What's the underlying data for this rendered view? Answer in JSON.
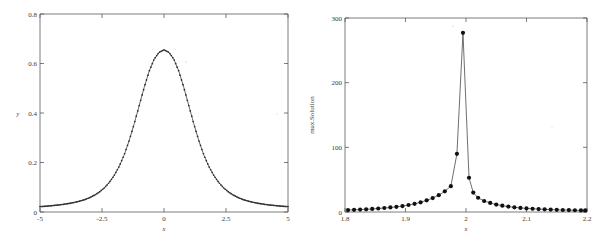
{
  "figure": {
    "background": "#ffffff",
    "panel_count": 2
  },
  "chart_data": [
    {
      "type": "line",
      "panel": "left",
      "title": "",
      "xlabel": "x",
      "ylabel": "y",
      "xlim": [
        -5,
        5
      ],
      "ylim": [
        0,
        0.8
      ],
      "xticks": [
        -5,
        -2.5,
        0,
        2.5,
        5
      ],
      "xticklabels": [
        "-5",
        "-2.5",
        "0",
        "2.5",
        "5"
      ],
      "yticks": [
        0,
        0.2,
        0.4,
        0.6,
        0.8
      ],
      "yticklabels": [
        "0",
        "0.2",
        "0.4",
        "0.6",
        "0.8"
      ],
      "grid": false,
      "legend": null,
      "marker": "dot",
      "marker_color": "#2e2e2e",
      "line_color": "#555555",
      "series": [
        {
          "name": "bell-curve",
          "x": [
            -5,
            -4.8,
            -4.6,
            -4.4,
            -4.2,
            -4,
            -3.8,
            -3.6,
            -3.4,
            -3.2,
            -3,
            -2.8,
            -2.6,
            -2.4,
            -2.2,
            -2,
            -1.8,
            -1.6,
            -1.4,
            -1.2,
            -1,
            -0.8,
            -0.6,
            -0.4,
            -0.2,
            0,
            0.2,
            0.4,
            0.6,
            0.8,
            1,
            1.2,
            1.4,
            1.6,
            1.8,
            2,
            2.2,
            2.4,
            2.6,
            2.8,
            3,
            3.2,
            3.4,
            3.6,
            3.8,
            4,
            4.2,
            4.4,
            4.6,
            4.8,
            5
          ],
          "y": [
            0.022,
            0.023,
            0.025,
            0.027,
            0.029,
            0.032,
            0.035,
            0.039,
            0.044,
            0.05,
            0.058,
            0.068,
            0.081,
            0.098,
            0.12,
            0.149,
            0.186,
            0.232,
            0.29,
            0.357,
            0.43,
            0.503,
            0.568,
            0.617,
            0.645,
            0.655,
            0.645,
            0.617,
            0.568,
            0.503,
            0.43,
            0.357,
            0.29,
            0.232,
            0.186,
            0.149,
            0.12,
            0.098,
            0.081,
            0.068,
            0.058,
            0.05,
            0.044,
            0.039,
            0.035,
            0.032,
            0.029,
            0.027,
            0.025,
            0.023,
            0.022
          ]
        }
      ]
    },
    {
      "type": "line",
      "panel": "right",
      "title": "",
      "xlabel": "x",
      "ylabel": "max.Solution",
      "xlim": [
        1.8,
        2.2
      ],
      "ylim": [
        0,
        300
      ],
      "xticks": [
        1.8,
        1.9,
        2,
        2.1,
        2.2
      ],
      "xticklabels": [
        "1.8",
        "1.9",
        "2",
        "2.1",
        "2.2"
      ],
      "yticks": [
        0,
        100,
        200,
        300
      ],
      "yticklabels": [
        "0",
        "100",
        "200",
        "300"
      ],
      "grid": false,
      "legend": null,
      "marker": "filled-circle",
      "marker_color": "#111111",
      "line_color": "#4a4a4a",
      "series": [
        {
          "name": "max-solution-resonance",
          "x": [
            1.805,
            1.815,
            1.825,
            1.835,
            1.845,
            1.855,
            1.865,
            1.875,
            1.885,
            1.895,
            1.905,
            1.915,
            1.925,
            1.935,
            1.945,
            1.955,
            1.965,
            1.975,
            1.985,
            1.995,
            2.005,
            2.012,
            2.02,
            2.03,
            2.04,
            2.05,
            2.06,
            2.07,
            2.08,
            2.09,
            2.1,
            2.11,
            2.12,
            2.13,
            2.14,
            2.15,
            2.16,
            2.17,
            2.18,
            2.19,
            2.197
          ],
          "y": [
            3,
            3.4,
            3.8,
            4.2,
            4.8,
            5.4,
            6.2,
            7.0,
            8.0,
            9.2,
            10.8,
            12.6,
            15.0,
            18.0,
            21.5,
            26.0,
            32.0,
            40.0,
            90.0,
            277.0,
            53.0,
            30.0,
            22.0,
            17.0,
            14.0,
            11.5,
            9.8,
            8.4,
            7.2,
            6.3,
            5.6,
            5.0,
            4.5,
            4.1,
            3.7,
            3.4,
            3.1,
            2.9,
            2.7,
            2.5,
            2.4
          ]
        }
      ]
    }
  ]
}
